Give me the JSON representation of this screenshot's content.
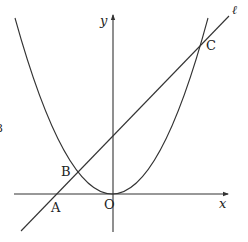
{
  "figure": {
    "type": "coordinate-diagram",
    "colors": {
      "stroke": "#333333",
      "text": "#222222",
      "background": "#ffffff"
    }
  },
  "axes": {
    "x_label": "x",
    "y_label": "y",
    "origin_label": "O"
  },
  "line": {
    "label": "ℓ"
  },
  "points": [
    {
      "id": "A",
      "label": "A",
      "on": "x-axis and line"
    },
    {
      "id": "B",
      "label": "B",
      "on": "parabola and line (left)"
    },
    {
      "id": "C",
      "label": "C",
      "on": "parabola and line (right)"
    }
  ],
  "margin_fragment": "3"
}
